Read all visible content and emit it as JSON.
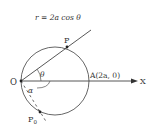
{
  "diagram": {
    "equation": "r = 2a cos θ",
    "points": {
      "origin": "O",
      "point_p": "P",
      "point_a": "A(2a, 0)",
      "point_p0_base": "P",
      "point_p0_sub": "0"
    },
    "axis_label": "X",
    "angles": {
      "theta": "θ",
      "alpha": "α"
    },
    "colors": {
      "stroke": "#444444",
      "text": "#333333"
    }
  }
}
